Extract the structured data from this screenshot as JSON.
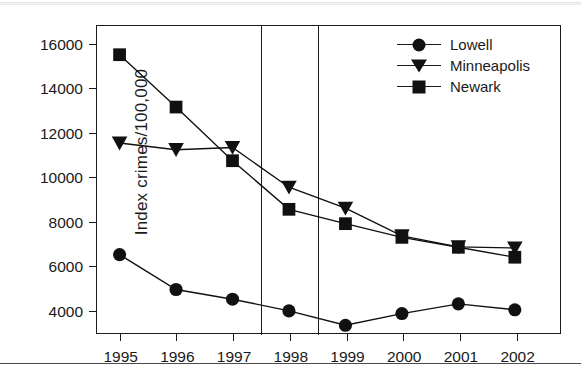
{
  "chart_data": {
    "type": "line",
    "title": "",
    "xlabel": "",
    "ylabel": "Index crimes/100,000",
    "categories": [
      "1995",
      "1996",
      "1997",
      "1998",
      "1999",
      "2000",
      "2001",
      "2002"
    ],
    "x": [
      1995,
      1996,
      1997,
      1998,
      1999,
      2000,
      2001,
      2002
    ],
    "xlim": [
      1994.6,
      2002.8
    ],
    "ylim": [
      2900,
      16800
    ],
    "yticks": [
      4000,
      6000,
      8000,
      10000,
      12000,
      14000,
      16000
    ],
    "ytick_labels": [
      "4000",
      "6000",
      "8000",
      "10000",
      "12000",
      "14000",
      "16000"
    ],
    "grid": false,
    "legend_position": "top-right",
    "series": [
      {
        "name": "Lowell",
        "marker": "circle",
        "color": "#111111",
        "values": [
          6450,
          4870,
          4430,
          3900,
          3250,
          3780,
          4220,
          3950
        ]
      },
      {
        "name": "Minneapolis",
        "marker": "triangle-down",
        "color": "#111111",
        "values": [
          11500,
          11200,
          11300,
          9500,
          8550,
          7300,
          6800,
          6750
        ]
      },
      {
        "name": "Newark",
        "marker": "square",
        "color": "#111111",
        "values": [
          15500,
          13130,
          10700,
          8500,
          7850,
          7230,
          6780,
          6330
        ]
      }
    ],
    "annotations": [
      {
        "type": "vertical-line",
        "x": 1997.5,
        "label": ""
      },
      {
        "type": "vertical-line",
        "x": 1998.5,
        "label": ""
      }
    ]
  },
  "legend": {
    "items": [
      {
        "label": "Lowell",
        "marker": "circle"
      },
      {
        "label": "Minneapolis",
        "marker": "triangle-down"
      },
      {
        "label": "Newark",
        "marker": "square"
      }
    ]
  },
  "footer": {
    "caption": ""
  }
}
